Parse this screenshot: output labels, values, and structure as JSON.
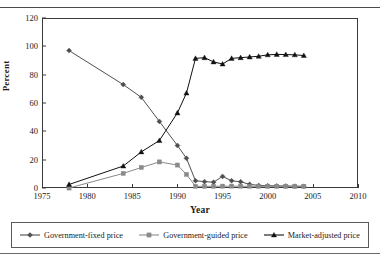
{
  "figure": {
    "ylabel": "Percent",
    "xlabel": "Year",
    "ytick_labels": [
      "0",
      "20",
      "40",
      "60",
      "80",
      "100",
      "120"
    ],
    "xtick_labels": [
      "1975",
      "1980",
      "1985",
      "1990",
      "1995",
      "2000",
      "2005",
      "2010"
    ]
  },
  "legend": {
    "items": [
      {
        "label": "Government-fixed price",
        "marker": "diamond-marker",
        "color": "#4f4f4f"
      },
      {
        "label": "Government-guided price",
        "marker": "square-marker",
        "color": "#8a8a8a"
      },
      {
        "label": "Market-adjusted price",
        "marker": "triangle-marker",
        "color": "#111111"
      }
    ]
  },
  "chart_data": {
    "type": "line",
    "title": "",
    "xlabel": "Year",
    "ylabel": "Percent",
    "xlim": [
      1975,
      2010
    ],
    "ylim": [
      0,
      120
    ],
    "xticks": [
      1975,
      1980,
      1985,
      1990,
      1995,
      2000,
      2005,
      2010
    ],
    "yticks": [
      0,
      20,
      40,
      60,
      80,
      100,
      120
    ],
    "grid": false,
    "legend_position": "bottom",
    "series": [
      {
        "name": "Government-fixed price",
        "marker": "diamond",
        "color": "#4f4f4f",
        "x": [
          1978,
          1984,
          1986,
          1988,
          1990,
          1991,
          1992,
          1993,
          1994,
          1995,
          1996,
          1997,
          1998,
          1999,
          2000,
          2001,
          2002,
          2003,
          2004
        ],
        "values": [
          97,
          73,
          64,
          47,
          30,
          21,
          5.1,
          4.5,
          4.1,
          8.2,
          5.1,
          4.4,
          2.6,
          1.8,
          1.6,
          1.5,
          1.4,
          1.3,
          1.2
        ]
      },
      {
        "name": "Government-guided price",
        "marker": "square",
        "color": "#8a8a8a",
        "x": [
          1978,
          1984,
          1986,
          1988,
          1990,
          1991,
          1992,
          1993,
          1994,
          1995,
          1996,
          1997,
          1998,
          1999,
          2000,
          2001,
          2002,
          2003,
          2004
        ],
        "values": [
          0,
          10.3,
          14.5,
          18.4,
          16.2,
          9.6,
          1.2,
          1.2,
          1.2,
          1.3,
          1.3,
          1.3,
          1.2,
          1.2,
          1.2,
          1.2,
          1.2,
          1.2,
          1.2
        ]
      },
      {
        "name": "Market-adjusted price",
        "marker": "triangle",
        "color": "#111111",
        "x": [
          1978,
          1984,
          1986,
          1988,
          1990,
          1991,
          1992,
          1993,
          1994,
          1995,
          1996,
          1997,
          1998,
          1999,
          2000,
          2001,
          2002,
          2003,
          2004
        ],
        "values": [
          2.5,
          15.5,
          25.5,
          33.5,
          53,
          67,
          91.5,
          92,
          89,
          87.5,
          91.5,
          92,
          92.5,
          93,
          94,
          94.3,
          94.2,
          94,
          93.5
        ]
      }
    ]
  }
}
